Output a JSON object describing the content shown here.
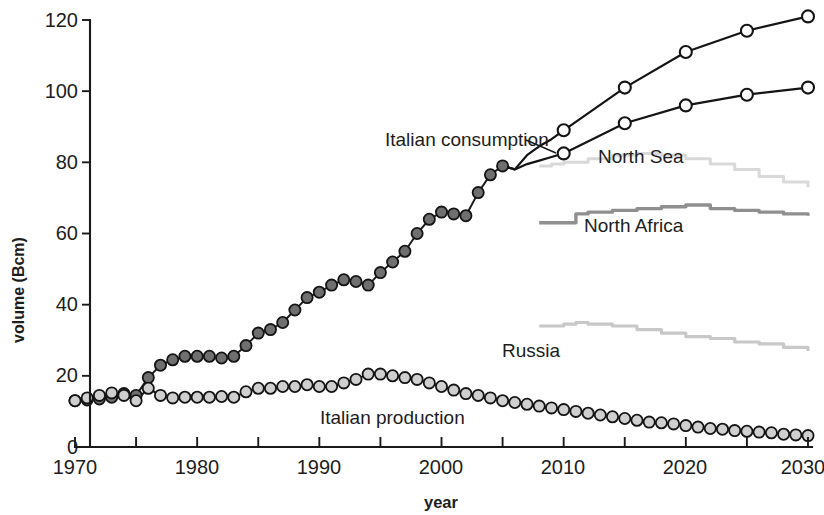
{
  "chart_data": {
    "type": "line",
    "title": "",
    "xlabel": "year",
    "ylabel": "volume (Bcm)",
    "xlim": [
      1970,
      2030
    ],
    "ylim": [
      0,
      120
    ],
    "xticks": [
      1970,
      1975,
      1980,
      1985,
      1990,
      1995,
      2000,
      2005,
      2010,
      2015,
      2020,
      2025,
      2030
    ],
    "xticklabels": [
      "1970",
      "",
      "1980",
      "",
      "1990",
      "",
      "2000",
      "",
      "2010",
      "",
      "2020",
      "",
      "2030"
    ],
    "yticks": [
      0,
      20,
      40,
      60,
      80,
      100,
      120
    ],
    "yticklabels": [
      "0",
      "20",
      "40",
      "60",
      "80",
      "100",
      "120"
    ],
    "grid": false,
    "legend_position": "inline-annotations",
    "series": [
      {
        "name": "Italian consumption",
        "style": "line-filled-dark-circles",
        "x": [
          1970,
          1971,
          1972,
          1973,
          1974,
          1975,
          1976,
          1977,
          1978,
          1979,
          1980,
          1981,
          1982,
          1983,
          1984,
          1985,
          1986,
          1987,
          1988,
          1989,
          1990,
          1991,
          1992,
          1993,
          1994,
          1995,
          1996,
          1997,
          1998,
          1999,
          2000,
          2001,
          2002,
          2003,
          2004,
          2005
        ],
        "values": [
          13,
          13.2,
          13.5,
          14,
          15,
          14.5,
          19.5,
          23,
          24.5,
          25.5,
          25.5,
          25.5,
          25,
          25.5,
          28.5,
          32,
          33,
          35,
          38.5,
          42,
          43.5,
          45.5,
          47,
          46.5,
          45.5,
          49,
          52,
          55,
          60,
          64,
          66,
          65.5,
          65,
          71.5,
          76.5,
          79
        ]
      },
      {
        "name": "Italian production",
        "style": "line-filled-light-circles",
        "x": [
          1970,
          1971,
          1972,
          1973,
          1974,
          1975,
          1976,
          1977,
          1978,
          1979,
          1980,
          1981,
          1982,
          1983,
          1984,
          1985,
          1986,
          1987,
          1988,
          1989,
          1990,
          1991,
          1992,
          1993,
          1994,
          1995,
          1996,
          1997,
          1998,
          1999,
          2000,
          2001,
          2002,
          2003,
          2004,
          2005,
          2006,
          2007,
          2008,
          2009,
          2010,
          2011,
          2012,
          2013,
          2014,
          2015,
          2016,
          2017,
          2018,
          2019,
          2020,
          2021,
          2022,
          2023,
          2024,
          2025,
          2026,
          2027,
          2028,
          2029,
          2030
        ],
        "values": [
          13,
          13.8,
          14.5,
          15.2,
          14.5,
          13,
          16.5,
          14.5,
          13.8,
          14,
          14,
          14,
          14.2,
          14,
          15.5,
          16.5,
          16.5,
          17,
          17,
          17.5,
          17,
          17,
          18,
          19,
          20.5,
          20.5,
          20,
          19.5,
          19,
          18,
          17,
          16,
          15,
          14.5,
          13.8,
          13,
          12.5,
          12,
          11.5,
          11,
          10.5,
          10,
          9.5,
          9,
          8.5,
          8,
          7.5,
          7,
          6.8,
          6.5,
          6,
          5.6,
          5.2,
          5,
          4.6,
          4.4,
          4.2,
          4,
          3.6,
          3.4,
          3.2
        ]
      },
      {
        "name": "Forecast high scenario",
        "style": "line-open-circles",
        "x": [
          2005,
          2006,
          2007,
          2008,
          2009,
          2010,
          2015,
          2020,
          2025,
          2030
        ],
        "values": [
          79,
          78,
          82,
          84.5,
          86.5,
          89,
          101,
          111,
          117,
          121
        ]
      },
      {
        "name": "Forecast low scenario",
        "style": "line-open-circles",
        "x": [
          2005,
          2006,
          2007,
          2008,
          2009,
          2010,
          2015,
          2020,
          2025,
          2030
        ],
        "values": [
          79,
          78,
          79.5,
          80.5,
          81.5,
          82.5,
          91,
          96,
          99,
          101
        ]
      },
      {
        "name": "North Sea",
        "style": "band-light-gray",
        "x": [
          2008,
          2009,
          2010,
          2012,
          2014,
          2016,
          2018,
          2020,
          2022,
          2024,
          2026,
          2028,
          2030
        ],
        "values": [
          79,
          79.5,
          80,
          81,
          82,
          82.5,
          82,
          81,
          79.5,
          78,
          76,
          74.5,
          73
        ]
      },
      {
        "name": "North Africa",
        "style": "band-mid-gray",
        "x": [
          2008,
          2009,
          2010,
          2011,
          2012,
          2014,
          2016,
          2018,
          2020,
          2022,
          2024,
          2026,
          2028,
          2030
        ],
        "values": [
          63,
          63,
          63,
          65.5,
          66,
          66.5,
          67,
          67.5,
          68,
          67,
          66.5,
          66,
          65.5,
          65
        ]
      },
      {
        "name": "Russia",
        "style": "band-light-gray",
        "x": [
          2008,
          2009,
          2010,
          2011,
          2012,
          2014,
          2016,
          2018,
          2020,
          2022,
          2024,
          2026,
          2028,
          2030
        ],
        "values": [
          34,
          34,
          34.5,
          35,
          34.5,
          34,
          33,
          32,
          31,
          30.5,
          29.5,
          29,
          28,
          27
        ]
      }
    ],
    "annotations": [
      {
        "text": "Italian consumption",
        "x": 2000,
        "y": 83
      },
      {
        "text": "North Sea",
        "x": 2013,
        "y": 79
      },
      {
        "text": "North Africa",
        "x": 2014,
        "y": 62
      },
      {
        "text": "Russia",
        "x": 2009,
        "y": 30
      },
      {
        "text": "Italian production",
        "x": 1995,
        "y": 8
      }
    ]
  },
  "labels": {
    "y_axis_title": "volume (Bcm)",
    "x_axis_title": "year",
    "italian_consumption": "Italian consumption",
    "italian_production": "Italian production",
    "north_sea": "North Sea",
    "north_africa": "North Africa",
    "russia": "Russia",
    "y_0": "0",
    "y_20": "20",
    "y_40": "40",
    "y_60": "60",
    "y_80": "80",
    "y_100": "100",
    "y_120": "120",
    "x_1970": "1970",
    "x_1980": "1980",
    "x_1990": "1990",
    "x_2000": "2000",
    "x_2010": "2010",
    "x_2020": "2020",
    "x_2030": "2030"
  },
  "colors": {
    "axis": "#1a1a1a",
    "consumption_marker": "#6f6f6f",
    "production_marker": "#cfcfcf",
    "north_sea": "#d9d9d9",
    "north_africa": "#8f8f8f",
    "russia": "#c8c8c8",
    "background": "#ffffff"
  }
}
